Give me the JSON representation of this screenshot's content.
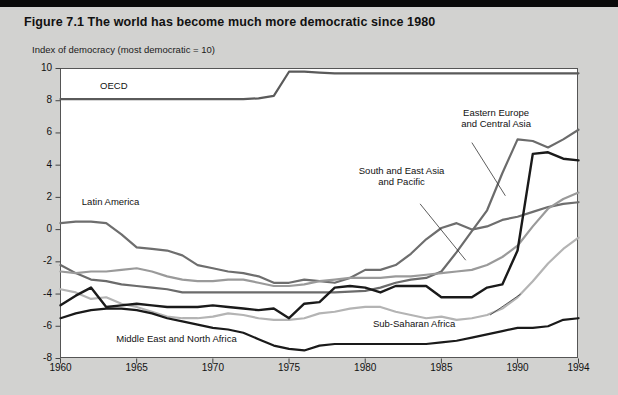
{
  "figure": {
    "title": "Figure 7.1  The world has become much more democratic since 1980",
    "axis_caption": "Index of democracy (most democratic = 10)"
  },
  "chart_data": {
    "type": "line",
    "title": "Figure 7.1  The world has become much more democratic since 1980",
    "subtitle": "Index of democracy (most democratic = 10)",
    "xlabel": "",
    "ylabel": "Index of democracy (most democratic = 10)",
    "xlim": [
      1960,
      1994
    ],
    "ylim": [
      -8,
      10
    ],
    "yticks": [
      -8,
      -6,
      -4,
      -2,
      0,
      2,
      4,
      6,
      8,
      10
    ],
    "ytick_labels": [
      "-8",
      "-6",
      "-4",
      "-2",
      "0",
      "2",
      "4",
      "6",
      "8",
      "10"
    ],
    "xticks": [
      1960,
      1965,
      1970,
      1975,
      1980,
      1985,
      1990,
      1994
    ],
    "xtick_labels": [
      "1960",
      "1965",
      "1970",
      "1975",
      "1980",
      "1985",
      "1990",
      "1994"
    ],
    "grid": false,
    "legend": "inline-annotations",
    "x": [
      1960,
      1961,
      1962,
      1963,
      1964,
      1965,
      1966,
      1967,
      1968,
      1969,
      1970,
      1971,
      1972,
      1973,
      1974,
      1975,
      1976,
      1977,
      1978,
      1979,
      1980,
      1981,
      1982,
      1983,
      1984,
      1985,
      1986,
      1987,
      1988,
      1989,
      1990,
      1991,
      1992,
      1993,
      1994
    ],
    "series": [
      {
        "name": "OECD",
        "color": "#5a5a5a",
        "width": 2.2,
        "label_x": 1963.2,
        "label_y": 8.9,
        "values": [
          8.1,
          8.1,
          8.1,
          8.1,
          8.1,
          8.1,
          8.1,
          8.1,
          8.1,
          8.1,
          8.1,
          8.1,
          8.1,
          8.15,
          8.3,
          9.8,
          9.8,
          9.75,
          9.7,
          9.7,
          9.7,
          9.7,
          9.7,
          9.7,
          9.7,
          9.7,
          9.7,
          9.7,
          9.7,
          9.7,
          9.7,
          9.7,
          9.7,
          9.7,
          9.7
        ]
      },
      {
        "name": "Eastern Europe and Central Asia",
        "color": "#6b6b6b",
        "width": 2.2,
        "label_x": 1986.6,
        "label_y": 6.6,
        "values": [
          -2.2,
          -2.7,
          -3.1,
          -3.2,
          -3.4,
          -3.5,
          -3.6,
          -3.7,
          -3.9,
          -3.9,
          -3.9,
          -3.9,
          -3.9,
          -3.9,
          -3.9,
          -3.9,
          -3.9,
          -3.9,
          -3.9,
          -3.85,
          -3.8,
          -3.6,
          -3.3,
          -3.1,
          -3.0,
          -2.6,
          -1.4,
          -0.1,
          1.2,
          3.5,
          5.6,
          5.5,
          5.1,
          5.6,
          6.2
        ]
      },
      {
        "name": "Latin America",
        "color": "#6e6e6e",
        "width": 2.2,
        "label_x": 1962.4,
        "label_y": 1.6,
        "values": [
          0.4,
          0.5,
          0.5,
          0.4,
          -0.3,
          -1.1,
          -1.2,
          -1.3,
          -1.6,
          -2.2,
          -2.4,
          -2.6,
          -2.7,
          -2.9,
          -3.3,
          -3.3,
          -3.1,
          -3.2,
          -3.3,
          -3.0,
          -2.5,
          -2.5,
          -2.2,
          -1.5,
          -0.6,
          0.1,
          0.4,
          0.0,
          0.2,
          0.6,
          0.8,
          1.1,
          1.4,
          1.6,
          1.7
        ]
      },
      {
        "name": "South and East Asia and Pacific",
        "color": "#9a9a9a",
        "width": 2.2,
        "label_x": 1981.8,
        "label_y": 3.1,
        "values": [
          -2.6,
          -2.7,
          -2.6,
          -2.6,
          -2.5,
          -2.4,
          -2.6,
          -2.9,
          -3.1,
          -3.2,
          -3.2,
          -3.1,
          -3.1,
          -3.3,
          -3.5,
          -3.5,
          -3.4,
          -3.2,
          -3.1,
          -3.0,
          -3.0,
          -3.0,
          -2.9,
          -2.9,
          -2.8,
          -2.7,
          -2.6,
          -2.5,
          -2.2,
          -1.7,
          -1.0,
          0.2,
          1.3,
          1.9,
          2.3
        ]
      },
      {
        "name": "Sub-Saharan Africa",
        "color": "#b4b4b4",
        "width": 2.2,
        "label_x": 1983.0,
        "label_y": -6.1,
        "values": [
          -3.7,
          -3.9,
          -4.3,
          -4.2,
          -4.6,
          -4.8,
          -5.1,
          -5.4,
          -5.5,
          -5.5,
          -5.4,
          -5.2,
          -5.3,
          -5.5,
          -5.6,
          -5.6,
          -5.5,
          -5.2,
          -5.1,
          -4.9,
          -4.8,
          -4.8,
          -5.1,
          -5.3,
          -5.5,
          -5.4,
          -5.6,
          -5.5,
          -5.3,
          -4.9,
          -4.2,
          -3.2,
          -2.1,
          -1.2,
          -0.5
        ]
      },
      {
        "name": "Middle East and North Africa",
        "color": "#1a1a1a",
        "width": 2.2,
        "label_x": 1965.4,
        "label_y": -6.9,
        "values": [
          -5.5,
          -5.2,
          -5.0,
          -4.9,
          -4.9,
          -5.0,
          -5.2,
          -5.5,
          -5.7,
          -5.9,
          -6.1,
          -6.2,
          -6.4,
          -6.8,
          -7.2,
          -7.4,
          -7.5,
          -7.2,
          -7.1,
          -7.1,
          -7.1,
          -7.1,
          -7.1,
          -7.1,
          -7.1,
          -7.0,
          -6.9,
          -6.7,
          -6.5,
          -6.3,
          -6.1,
          -6.1,
          -6.0,
          -5.6,
          -5.5
        ]
      },
      {
        "name": "unlabeled-dark-series",
        "color": "#1a1a1a",
        "width": 2.4,
        "label_x": null,
        "label_y": null,
        "values": [
          -4.7,
          -4.1,
          -3.6,
          -4.8,
          -4.7,
          -4.6,
          -4.7,
          -4.8,
          -4.8,
          -4.8,
          -4.7,
          -4.8,
          -4.9,
          -5.0,
          -4.9,
          -5.5,
          -4.6,
          -4.5,
          -3.6,
          -3.5,
          -3.6,
          -3.9,
          -3.5,
          -3.5,
          -3.5,
          -4.2,
          -4.2,
          -4.2,
          -3.6,
          -3.4,
          -1.3,
          4.7,
          4.8,
          4.4,
          4.3
        ]
      }
    ],
    "annotations": [
      {
        "text": "OECD",
        "x": 1963.2,
        "y": 8.9
      },
      {
        "text": "Latin America",
        "x": 1962.4,
        "y": 1.6
      },
      {
        "text": "Eastern Europe\nand Central Asia",
        "x": 1986.6,
        "y": 6.6
      },
      {
        "text": "South and East Asia\nand Pacific",
        "x": 1981.8,
        "y": 3.1
      },
      {
        "text": "Sub-Saharan Africa",
        "x": 1983.0,
        "y": -6.1
      },
      {
        "text": "Middle East and North Africa",
        "x": 1965.4,
        "y": -6.9
      }
    ]
  },
  "labels": {
    "oecd": "OECD",
    "latin_america": "Latin America",
    "eastern_europe_1": "Eastern Europe",
    "eastern_europe_2": "and Central Asia",
    "south_east_asia_1": "South and East Asia",
    "south_east_asia_2": "and Pacific",
    "sub_saharan": "Sub-Saharan Africa",
    "middle_east": "Middle East and North Africa"
  },
  "yticks": [
    "10",
    "8",
    "6",
    "4",
    "2",
    "0",
    "-2",
    "-4",
    "-6",
    "-8"
  ],
  "xticks": [
    "1960",
    "1965",
    "1970",
    "1975",
    "1980",
    "1985",
    "1990",
    "1994"
  ],
  "colors": {
    "page_bg": "#d2d2d0",
    "plot_bg": "#ffffff",
    "topbar": "#0a0a0a",
    "text": "#111111"
  }
}
